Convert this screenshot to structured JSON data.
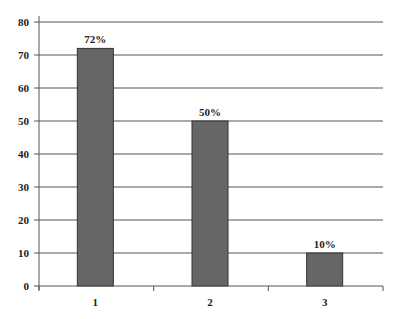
{
  "chart_data": {
    "type": "bar",
    "title": "",
    "xlabel": "",
    "ylabel": "",
    "categories": [
      "1",
      "2",
      "3"
    ],
    "values": [
      72,
      50,
      10
    ],
    "data_labels": [
      "72%",
      "50%",
      "10%"
    ],
    "ylim": [
      0,
      80
    ],
    "yticks": [
      0,
      10,
      20,
      30,
      40,
      50,
      60,
      70,
      80
    ],
    "grid": true,
    "legend": null,
    "bar_color": "#666666",
    "bar_border": "#333333",
    "grid_color": "#555555"
  }
}
